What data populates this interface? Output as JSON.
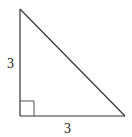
{
  "diagram": {
    "type": "right-triangle",
    "labels": {
      "left_leg": "3",
      "bottom_leg": "3"
    },
    "vertices": {
      "top": [
        20,
        9
      ],
      "right_angle": [
        20,
        116
      ],
      "bottom_right": [
        125,
        116
      ]
    },
    "right_angle_marker_size": 14,
    "colors": {
      "stroke": "#333333",
      "marker": "#555555",
      "background": "#ffffff"
    }
  }
}
